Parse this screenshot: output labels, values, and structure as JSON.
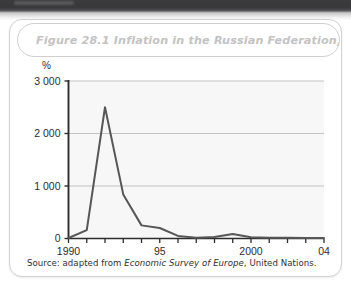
{
  "figure": {
    "title": "Figure 28.1  Inflation in the Russian Federation, 1990-2004",
    "source_prefix": "Source: adapted from ",
    "source_publication": "Economic Survey of Europe",
    "source_suffix": ", United Nations."
  },
  "colors": {
    "line": "#575757",
    "gridline": "#bcbcbc",
    "axis": "#2d2d2d",
    "plot_background": "#f7f7f7",
    "title_text": "#c3c3c3",
    "card_border": "#d2d2d2",
    "page_edge": "#3b3b3d"
  },
  "chart_data": {
    "type": "line",
    "title": "Inflation in the Russian Federation, 1990-2004",
    "xlabel": "",
    "ylabel": "%",
    "yunit": "%",
    "xlim": [
      1990,
      2004
    ],
    "ylim": [
      0,
      3000
    ],
    "grid": true,
    "legend": null,
    "ytick_labels": [
      "0",
      "1 000",
      "2 000",
      "3 000"
    ],
    "ytick_values": [
      0,
      1000,
      2000,
      3000
    ],
    "xtick_values": [
      1990,
      1991,
      1992,
      1993,
      1994,
      1995,
      1996,
      1997,
      1998,
      1999,
      2000,
      2001,
      2002,
      2003,
      2004
    ],
    "xtick_labels": [
      "1990",
      "",
      "",
      "",
      "",
      "95",
      "",
      "",
      "",
      "",
      "2000",
      "",
      "",
      "",
      "04"
    ],
    "x": [
      1990,
      1991,
      1992,
      1993,
      1994,
      1995,
      1996,
      1997,
      1998,
      1999,
      2000,
      2001,
      2002,
      2003,
      2004
    ],
    "values": [
      10,
      160,
      2500,
      840,
      250,
      200,
      50,
      15,
      30,
      85,
      22,
      15,
      12,
      10,
      8
    ],
    "series": [
      {
        "name": "Inflation",
        "values": [
          10,
          160,
          2500,
          840,
          250,
          200,
          50,
          15,
          30,
          85,
          22,
          15,
          12,
          10,
          8
        ]
      }
    ]
  }
}
